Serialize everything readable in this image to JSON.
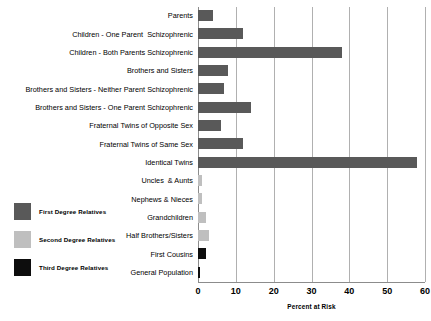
{
  "chart_data": {
    "type": "bar",
    "orientation": "horizontal",
    "title": "",
    "xlabel": "Percent at Risk",
    "ylabel": "",
    "xlim": [
      0,
      60
    ],
    "xticks": [
      0,
      10,
      20,
      30,
      40,
      50,
      60
    ],
    "grid": true,
    "legend_position": "left-middle",
    "categories": [
      "Parents",
      "Children - One Parent  Schizophrenic",
      "Children - Both Parents Schizophrenic",
      "Brothers and Sisters",
      "Brothers and Sisters - Neither Parent Schizophrenic",
      "Brothers and Sisters - One Parent Schizophrenic",
      "Fraternal Twins of Opposite Sex",
      "Fraternal Twins of Same Sex",
      "Identical Twins",
      "Uncles  & Aunts",
      "Nephews & Nieces",
      "Grandchildren",
      "Half Brothers/Sisters",
      "First Cousins",
      "General Population"
    ],
    "values": [
      4,
      12,
      38,
      8,
      7,
      14,
      6,
      12,
      58,
      1,
      1,
      2,
      3,
      2,
      0.5
    ],
    "groups": [
      "first-degree",
      "first-degree",
      "first-degree",
      "first-degree",
      "first-degree",
      "first-degree",
      "first-degree",
      "first-degree",
      "first-degree",
      "second-degree",
      "second-degree",
      "second-degree",
      "second-degree",
      "third-degree",
      "third-degree"
    ],
    "series": [
      {
        "name": "First Degree Relatives",
        "color": "#595959"
      },
      {
        "name": "Second Degree Relatives",
        "color": "#bfbfbf"
      },
      {
        "name": "Third Degree Relatives",
        "color": "#0d0d0d"
      }
    ]
  },
  "legend": {
    "items": [
      {
        "label": "First Degree Relatives",
        "color": "#595959"
      },
      {
        "label": "Second Degree Relatives",
        "color": "#bfbfbf"
      },
      {
        "label": "Third Degree Relatives",
        "color": "#0d0d0d"
      }
    ]
  },
  "axis": {
    "x_title": "Percent at Risk",
    "tick_labels": [
      "0",
      "10",
      "20",
      "30",
      "40",
      "50",
      "60"
    ]
  },
  "colors": {
    "first_degree": "#595959",
    "second_degree": "#bfbfbf",
    "third_degree": "#0d0d0d",
    "gridline": "#b0b0b0",
    "axis": "#8c8c8c",
    "background": "#ffffff",
    "text": "#000000"
  }
}
